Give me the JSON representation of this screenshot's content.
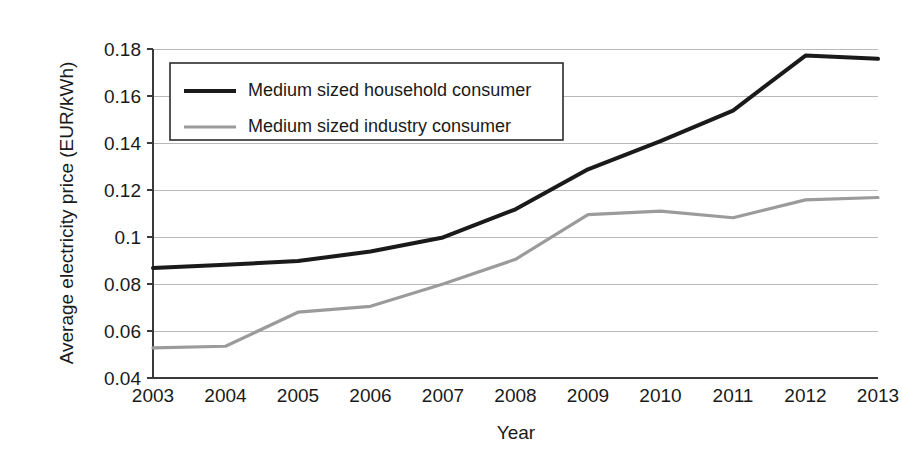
{
  "chart_data": {
    "type": "line",
    "title": "",
    "xlabel": "Year",
    "ylabel": "Average electricity price (EUR/kWh)",
    "categories": [
      "2003",
      "2004",
      "2005",
      "2006",
      "2007",
      "2008",
      "2009",
      "2010",
      "2011",
      "2012",
      "2013"
    ],
    "x": [
      2003,
      2004,
      2005,
      2006,
      2007,
      2008,
      2009,
      2010,
      2011,
      2012,
      2013
    ],
    "xlim": [
      2003,
      2013
    ],
    "ylim": [
      0.04,
      0.18
    ],
    "ytick_labels": [
      "0.04",
      "0.06",
      "0.08",
      "0.1",
      "0.12",
      "0.14",
      "0.16",
      "0.18"
    ],
    "yticks": [
      0.04,
      0.06,
      0.08,
      0.1,
      0.12,
      0.14,
      0.16,
      0.18
    ],
    "grid": true,
    "legend_position": "top-left-inside",
    "series": [
      {
        "name": "Medium sized household consumer",
        "color": "#1a1a1a",
        "width": 4,
        "values": [
          0.0868,
          0.0882,
          0.0898,
          0.0938,
          0.0998,
          0.1118,
          0.1288,
          0.1408,
          0.1538,
          0.1772,
          0.1758
        ]
      },
      {
        "name": "Medium sized industry consumer",
        "color": "#9b9b9b",
        "width": 3.2,
        "values": [
          0.0528,
          0.0535,
          0.068,
          0.0705,
          0.08,
          0.0905,
          0.1095,
          0.111,
          0.1082,
          0.1158,
          0.1168
        ]
      }
    ]
  },
  "legend": {
    "items": [
      {
        "label": "Medium sized household consumer",
        "color": "#1a1a1a",
        "width": 4
      },
      {
        "label": "Medium sized industry consumer",
        "color": "#9b9b9b",
        "width": 3.2
      }
    ]
  }
}
